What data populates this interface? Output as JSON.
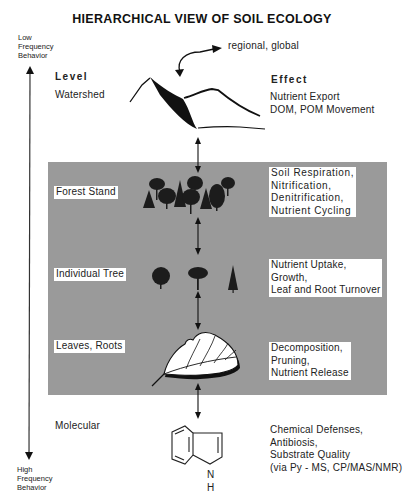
{
  "title": "HIERARCHICAL VIEW OF SOIL ECOLOGY",
  "axis": {
    "top_label": [
      "Low",
      "Frequency",
      "Behavior"
    ],
    "bottom_label": [
      "High",
      "Frequency",
      "Behavior"
    ]
  },
  "headers": {
    "level": "Level",
    "effect": "Effect"
  },
  "scale_note": "regional,  global",
  "levels": [
    {
      "name": "Watershed",
      "effects": [
        "Nutrient  Export",
        "DOM, POM Movement"
      ],
      "icon": "mountain-icon"
    },
    {
      "name": "Forest  Stand",
      "effects": [
        "Soil  Respiration,",
        "Nitrification,",
        "Denitrification,",
        "Nutrient  Cycling"
      ],
      "icon": "forest-icon"
    },
    {
      "name": "Individual  Tree",
      "effects": [
        "Nutrient  Uptake,",
        "Growth,",
        "Leaf and  Root Turnover"
      ],
      "icon": "trees-icon"
    },
    {
      "name": "Leaves,  Roots",
      "effects": [
        "Decomposition,",
        "Pruning,",
        "Nutrient  Release"
      ],
      "icon": "leaf-icon"
    },
    {
      "name": "Molecular",
      "effects": [
        "Chemical  Defenses,",
        "Antibiosis,",
        "Substrate  Quality",
        "(via Py - MS,  CP/MAS/NMR)"
      ],
      "icon": "indole-molecule-icon"
    }
  ],
  "molecule_labels": {
    "n": "N",
    "h": "H"
  },
  "colors": {
    "shaded_region": "#9a9a9a",
    "ink": "#111111",
    "background": "#ffffff"
  }
}
